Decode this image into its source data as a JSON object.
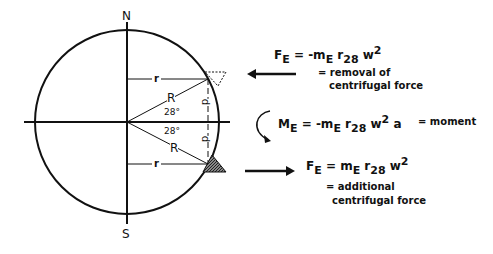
{
  "diagram": {
    "compass": {
      "north": "N",
      "south": "S"
    },
    "labels": {
      "r_top": "r",
      "r_bottom": "r",
      "R_top": "R",
      "R_bottom": "R",
      "angle_top": "28°",
      "angle_bottom": "28°",
      "d_top": "d",
      "d_bottom": "d"
    },
    "equations": {
      "top": {
        "lhs": "F",
        "lhs_sub": "E",
        "eq": " = -m",
        "m_sub": "E",
        "r": " r",
        "r_sub": "28",
        "w": " w",
        "w_sup": "2",
        "desc_line1": "= removal of",
        "desc_line2": "centrifugal force"
      },
      "middle": {
        "lhs": "M",
        "lhs_sub": "E",
        "eq": " = -m",
        "m_sub": "E",
        "r": " r",
        "r_sub": "28",
        "w": " w",
        "w_sup": "2",
        "tail": " a",
        "desc": "= moment"
      },
      "bottom": {
        "lhs": "F",
        "lhs_sub": "E",
        "eq": " =  m",
        "m_sub": "E",
        "r": " r",
        "r_sub": "28",
        "w": " w",
        "w_sup": "2",
        "desc_line1": "= additional",
        "desc_line2": "centrifugal force"
      }
    }
  }
}
